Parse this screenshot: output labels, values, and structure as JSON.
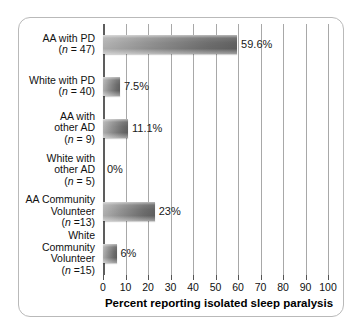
{
  "chart_data": {
    "type": "bar",
    "orientation": "horizontal",
    "title": "",
    "xlabel": "Percent reporting isolated sleep paralysis",
    "ylabel": "",
    "xlim": [
      0,
      100
    ],
    "grid": true,
    "legend": "none",
    "xticks": [
      0,
      10,
      20,
      30,
      40,
      50,
      60,
      70,
      80,
      90,
      100
    ],
    "xtick_labels": [
      "0",
      "10",
      "20",
      "30",
      "40",
      "50",
      "60",
      "70",
      "80",
      "90",
      "100"
    ],
    "categories": [
      "AA with PD (n = 47)",
      "White with PD (n = 40)",
      "AA with other AD (n = 9)",
      "White with other AD (n = 5)",
      "AA Community Volunteer (n =13)",
      "White Community Volunteer (n =15)"
    ],
    "values": [
      59.6,
      7.5,
      11.1,
      0,
      23,
      6
    ],
    "value_labels": [
      "59.6%",
      "7.5%",
      "11.1%",
      "0%",
      "23%",
      "6%"
    ],
    "bars": [
      {
        "name_lines": [
          "AA with PD"
        ],
        "n_label": "(n = 47)",
        "value": 59.6,
        "value_label": "59.6%"
      },
      {
        "name_lines": [
          "White with PD"
        ],
        "n_label": "(n = 40)",
        "value": 7.5,
        "value_label": "7.5%"
      },
      {
        "name_lines": [
          "AA with",
          "other AD"
        ],
        "n_label": "(n = 9)",
        "value": 11.1,
        "value_label": "11.1%"
      },
      {
        "name_lines": [
          "White with",
          "other AD"
        ],
        "n_label": "(n = 5)",
        "value": 0,
        "value_label": "0%"
      },
      {
        "name_lines": [
          "AA Community",
          "Volunteer"
        ],
        "n_label": "(n =13)",
        "value": 23,
        "value_label": "23%"
      },
      {
        "name_lines": [
          "White",
          "Community",
          "Volunteer"
        ],
        "n_label": "(n =15)",
        "value": 6,
        "value_label": "6%"
      }
    ]
  },
  "style": {
    "bar_color_light": "#b3b3b3",
    "bar_color_dark": "#616161",
    "gridline_color": "#a8a8a8",
    "axis_color": "#5d5d5d",
    "frame_color": "#b9b9b9",
    "background": "#ffffff",
    "text_color": "#111111"
  }
}
